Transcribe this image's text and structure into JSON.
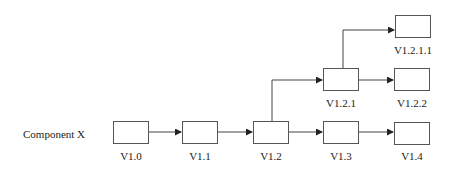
{
  "diagram": {
    "row_label": "Component X",
    "nodes": [
      {
        "id": "v1_0",
        "label": "V1.0",
        "x": 113,
        "y": 121
      },
      {
        "id": "v1_1",
        "label": "V1.1",
        "x": 182,
        "y": 121
      },
      {
        "id": "v1_2",
        "label": "V1.2",
        "x": 253,
        "y": 121
      },
      {
        "id": "v1_3",
        "label": "V1.3",
        "x": 323,
        "y": 121
      },
      {
        "id": "v1_4",
        "label": "V1.4",
        "x": 394,
        "y": 122
      },
      {
        "id": "v1_2_1",
        "label": "V1.2.1",
        "x": 323,
        "y": 68
      },
      {
        "id": "v1_2_2",
        "label": "V1.2.2",
        "x": 394,
        "y": 68
      },
      {
        "id": "v1_2_1_1",
        "label": "V1.2.1.1",
        "x": 395,
        "y": 15
      }
    ],
    "edges": [
      {
        "from": "V1.0",
        "to": "V1.1"
      },
      {
        "from": "V1.1",
        "to": "V1.2"
      },
      {
        "from": "V1.2",
        "to": "V1.3"
      },
      {
        "from": "V1.3",
        "to": "V1.4"
      },
      {
        "from": "V1.2",
        "to": "V1.2.1"
      },
      {
        "from": "V1.2.1",
        "to": "V1.2.2"
      },
      {
        "from": "V1.2.1",
        "to": "V1.2.1.1"
      }
    ]
  }
}
